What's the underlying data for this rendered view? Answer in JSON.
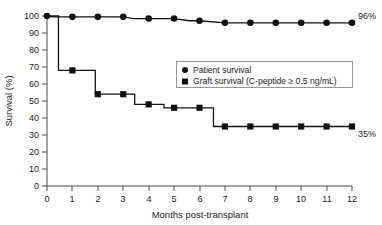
{
  "chart_data": {
    "type": "line",
    "title": "",
    "xlabel": "Months post-transplant",
    "ylabel": "Survival (%)",
    "xlim": [
      0,
      12
    ],
    "ylim": [
      0,
      100
    ],
    "xticks": [
      "0",
      "1",
      "2",
      "3",
      "4",
      "5",
      "6",
      "7",
      "8",
      "9",
      "10",
      "11",
      "12"
    ],
    "yticks": [
      "0",
      "10",
      "20",
      "30",
      "40",
      "50",
      "60",
      "70",
      "80",
      "90",
      "100"
    ],
    "grid": false,
    "legend_position": "upper-right-inside",
    "series": [
      {
        "name": "Patient survival",
        "marker": "circle",
        "end_label": "96%",
        "x": [
          0,
          0.2,
          1,
          2,
          3,
          3.4,
          4,
          5,
          5.6,
          6,
          7,
          8,
          9,
          10,
          11,
          12
        ],
        "y": [
          100,
          99.5,
          99.5,
          99.5,
          99.5,
          98.5,
          98.5,
          98.5,
          97.2,
          97.2,
          96,
          96,
          96,
          96,
          96,
          96
        ],
        "marker_x": [
          0,
          1,
          2,
          3,
          4,
          5,
          6,
          7,
          8,
          9,
          10,
          11,
          12
        ],
        "marker_y": [
          100,
          99.5,
          99.5,
          99.5,
          98.5,
          98.5,
          97.2,
          96,
          96,
          96,
          96,
          96,
          96
        ]
      },
      {
        "name": "Graft survival (C-peptide ≥ 0.5 ng/mL)",
        "marker": "square",
        "end_label": "35%",
        "x": [
          0,
          0.45,
          0.45,
          1,
          1.9,
          1.9,
          2,
          3,
          3.45,
          3.45,
          4,
          4.6,
          4.6,
          5,
          6,
          6.55,
          6.55,
          7,
          8,
          9,
          10,
          11,
          12
        ],
        "y": [
          100,
          100,
          68,
          68,
          68,
          54,
          54,
          54,
          54,
          48,
          48,
          48,
          46,
          46,
          46,
          46,
          35,
          35,
          35,
          35,
          35,
          35,
          35
        ],
        "marker_x": [
          1,
          2,
          3,
          4,
          5,
          6,
          7,
          8,
          9,
          10,
          11,
          12
        ],
        "marker_y": [
          68,
          54,
          54,
          48,
          46,
          46,
          35,
          35,
          35,
          35,
          35,
          35
        ]
      }
    ],
    "annotations": [
      {
        "text": "96%",
        "x": 12,
        "y": 96
      },
      {
        "text": "35%",
        "x": 12,
        "y": 35
      }
    ],
    "colors": {
      "line": "#111111",
      "axis": "#4a4a4a",
      "text": "#1a1a1a",
      "legend_border": "#8a8a8a"
    }
  },
  "legend": {
    "items": [
      {
        "label": "Patient survival",
        "marker": "circle"
      },
      {
        "label": "Graft survival (C-peptide ≥ 0.5 ng/mL)",
        "marker": "square"
      }
    ]
  }
}
